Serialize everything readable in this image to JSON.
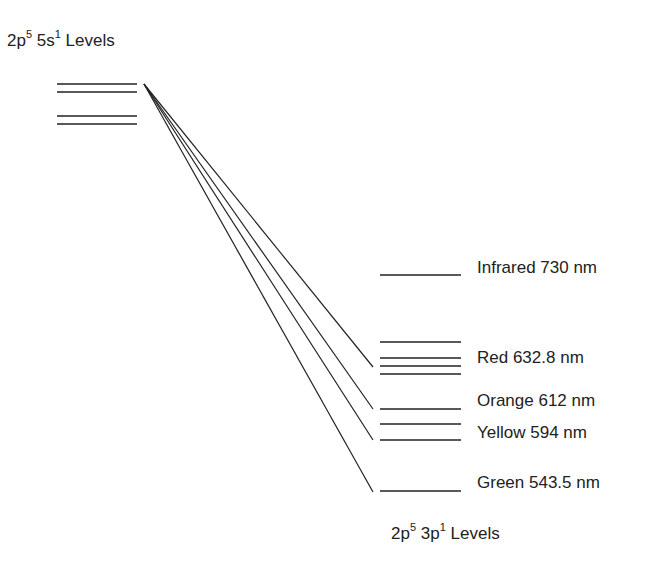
{
  "title_upper": {
    "config": "2p",
    "exp1": "5",
    "mid": " 5s",
    "exp2": "1",
    "suffix": " Levels"
  },
  "title_lower": {
    "config": "2p",
    "exp1": "5",
    "mid": " 3p",
    "exp2": "1",
    "suffix": " Levels"
  },
  "origin": {
    "x": 144,
    "y": 84
  },
  "upper_levels": [
    {
      "y": 84,
      "x1": 57,
      "x2": 137
    },
    {
      "y": 92,
      "x1": 57,
      "x2": 137
    },
    {
      "y": 116,
      "x1": 57,
      "x2": 137
    },
    {
      "y": 124,
      "x1": 57,
      "x2": 137
    }
  ],
  "lower_levels": [
    {
      "y": 275,
      "x1": 380,
      "x2": 461
    },
    {
      "y": 342,
      "x1": 380,
      "x2": 461
    },
    {
      "y": 358,
      "x1": 380,
      "x2": 461
    },
    {
      "y": 366,
      "x1": 380,
      "x2": 461
    },
    {
      "y": 374,
      "x1": 380,
      "x2": 461
    },
    {
      "y": 409,
      "x1": 380,
      "x2": 461
    },
    {
      "y": 424,
      "x1": 380,
      "x2": 461
    },
    {
      "y": 440,
      "x1": 380,
      "x2": 461
    },
    {
      "y": 491,
      "x1": 380,
      "x2": 461
    }
  ],
  "transitions": [
    {
      "x": 373,
      "y": 367
    },
    {
      "x": 373,
      "y": 409
    },
    {
      "x": 373,
      "y": 440
    },
    {
      "x": 373,
      "y": 492
    }
  ],
  "labels": [
    {
      "text": "Infrared 730 nm",
      "x": 477,
      "y": 258
    },
    {
      "text": "Red 632.8 nm",
      "x": 477,
      "y": 348
    },
    {
      "text": "Orange 612 nm",
      "x": 477,
      "y": 391
    },
    {
      "text": "Yellow 594 nm",
      "x": 477,
      "y": 423
    },
    {
      "text": "Green 543.5 nm",
      "x": 477,
      "y": 473
    }
  ],
  "line_color": "#222222"
}
